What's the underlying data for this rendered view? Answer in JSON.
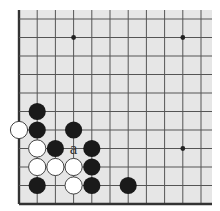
{
  "diagram": {
    "type": "go-board-corner",
    "colors": {
      "board": "#e6e6e6",
      "line": "#555555",
      "edge": "#333333",
      "black_stone": "#1a1a1a",
      "white_stone": "#ffffff",
      "white_stone_border": "#444444",
      "star_point": "#222222"
    },
    "grid": {
      "columns": 11,
      "rows": 11,
      "open_top": true,
      "open_right": true
    },
    "star_points": [
      {
        "col": 3,
        "row": 1
      },
      {
        "col": 9,
        "row": 1
      },
      {
        "col": 9,
        "row": 7
      }
    ],
    "stones": [
      {
        "color": "black",
        "col": 1,
        "row": 5
      },
      {
        "color": "white",
        "col": 0,
        "row": 6
      },
      {
        "color": "black",
        "col": 1,
        "row": 6
      },
      {
        "color": "black",
        "col": 3,
        "row": 6
      },
      {
        "color": "white",
        "col": 1,
        "row": 7
      },
      {
        "color": "black",
        "col": 2,
        "row": 7
      },
      {
        "color": "black",
        "col": 4,
        "row": 7
      },
      {
        "color": "white",
        "col": 1,
        "row": 8
      },
      {
        "color": "white",
        "col": 2,
        "row": 8
      },
      {
        "color": "white",
        "col": 3,
        "row": 8
      },
      {
        "color": "black",
        "col": 4,
        "row": 8
      },
      {
        "color": "black",
        "col": 1,
        "row": 9
      },
      {
        "color": "white",
        "col": 3,
        "row": 9
      },
      {
        "color": "black",
        "col": 4,
        "row": 9
      },
      {
        "color": "black",
        "col": 6,
        "row": 9
      }
    ],
    "labels": [
      {
        "text": "a",
        "col": 3,
        "row": 7
      }
    ]
  }
}
